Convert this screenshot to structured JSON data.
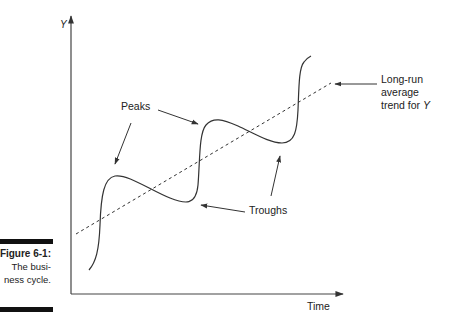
{
  "figure": {
    "caption_title": "Figure 6-1:",
    "caption_line1": "The busi-",
    "caption_line2": "ness cycle."
  },
  "axes": {
    "y_label": "Y",
    "x_label": "Time"
  },
  "annotations": {
    "peaks": "Peaks",
    "troughs": "Troughs",
    "trend_line1": "Long-run",
    "trend_line2": "average",
    "trend_line3_prefix": "trend for ",
    "trend_line3_var": "Y"
  },
  "colors": {
    "line": "#333333",
    "caption_bar": "#111111",
    "background": "#ffffff"
  }
}
